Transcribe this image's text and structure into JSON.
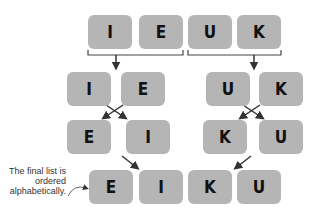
{
  "diagram": {
    "rows": [
      {
        "name": "initial",
        "items": [
          "I",
          "E",
          "U",
          "K"
        ]
      },
      {
        "name": "split",
        "left": [
          "I",
          "E"
        ],
        "right": [
          "U",
          "K"
        ]
      },
      {
        "name": "sorted-pairs",
        "left": [
          "E",
          "I"
        ],
        "right": [
          "K",
          "U"
        ]
      },
      {
        "name": "merged",
        "items": [
          "E",
          "I",
          "K",
          "U"
        ]
      }
    ],
    "annotation": {
      "line1": "The final list is",
      "line2": "ordered",
      "line3": "alphabetically."
    },
    "colors": {
      "box": "#b5b5b5",
      "arrow": "#333333",
      "text": "#111111"
    }
  }
}
